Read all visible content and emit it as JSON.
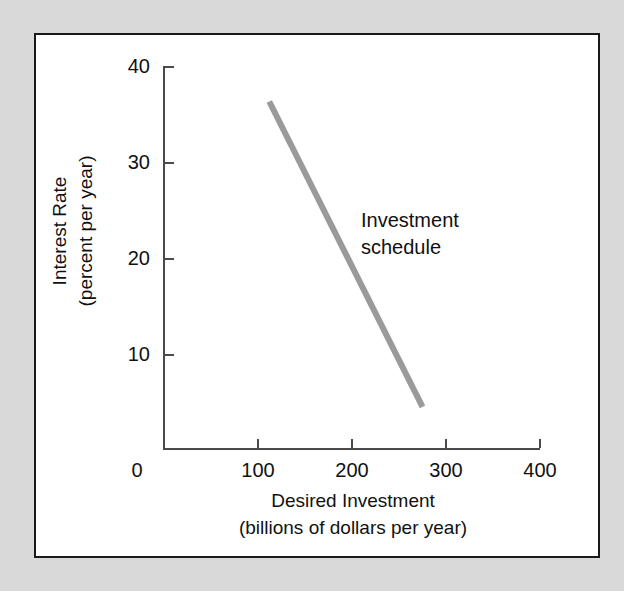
{
  "figure": {
    "background_color": "#d9d9d9",
    "panel_color": "#ffffff",
    "panel_border_color": "#1a1a1a",
    "axis_color": "#4a4a4a"
  },
  "chart_data": {
    "type": "line",
    "title": "",
    "xlabel": "Desired Investment",
    "xlabel_line2": "(billions of dollars per year)",
    "ylabel": "Interest Rate",
    "ylabel_line2": "(percent per year)",
    "xlim": [
      0,
      400
    ],
    "ylim": [
      0,
      40
    ],
    "xticks": [
      0,
      100,
      200,
      300,
      400
    ],
    "xtick_labels": [
      "0",
      "100",
      "200",
      "300",
      "400"
    ],
    "yticks": [
      10,
      20,
      30,
      40
    ],
    "ytick_labels": [
      "10",
      "20",
      "30",
      "40"
    ],
    "grid": false,
    "legend_position": "inline-annotation",
    "series": [
      {
        "name": "Investment schedule",
        "color": "#9a9a9a",
        "line_width": 6,
        "annotation": "Investment\nschedule",
        "annotation_line1": "Investment",
        "annotation_line2": "schedule",
        "x": [
          112,
          275
        ],
        "y": [
          36.3,
          4.5
        ],
        "points": [
          {
            "x": 112,
            "y": 36.3
          },
          {
            "x": 275,
            "y": 4.5
          }
        ]
      }
    ]
  },
  "annotations": {
    "series_label_line1": "Investment",
    "series_label_line2": "schedule"
  }
}
